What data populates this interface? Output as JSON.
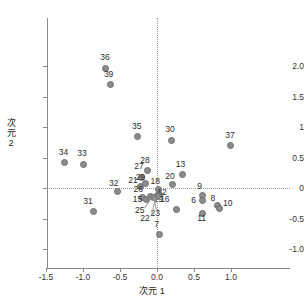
{
  "chart_data": {
    "type": "scatter",
    "title": "",
    "xlabel": "次元 1",
    "ylabel": "次元 2",
    "xlim": [
      -1.85,
      1.35
    ],
    "ylim": [
      -1.05,
      2.25
    ],
    "xticks": [
      "-1.5",
      "-1.0",
      "-0.5",
      "0.0",
      "0.5",
      "1.0"
    ],
    "xtick_values": [
      -1.5,
      -1.0,
      -0.5,
      0.0,
      0.5,
      1.0
    ],
    "yticks": [
      "2.0",
      "1.5",
      "1",
      "0.5",
      "0",
      "-0.5",
      "-1.0"
    ],
    "ytick_values": [
      2.0,
      1.5,
      1.0,
      0.5,
      0.0,
      -0.5,
      -1.0
    ],
    "grid": false,
    "reference_lines": {
      "x": 0,
      "y": 0,
      "style": "dotted"
    },
    "marker_color": "#8c8c8c",
    "legend": "none",
    "points": [
      {
        "label": "36",
        "x": -0.7,
        "y": 1.96,
        "lx": -0.7,
        "ly": 2.13
      },
      {
        "label": "39",
        "x": -0.63,
        "y": 1.69,
        "lx": -0.65,
        "ly": 1.86
      },
      {
        "label": "35",
        "x": -0.27,
        "y": 0.84,
        "lx": -0.27,
        "ly": 1.0
      },
      {
        "label": "30",
        "x": 0.19,
        "y": 0.78,
        "lx": 0.18,
        "ly": 0.95
      },
      {
        "label": "37",
        "x": 0.99,
        "y": 0.69,
        "lx": 0.99,
        "ly": 0.85
      },
      {
        "label": "34",
        "x": -1.25,
        "y": 0.42,
        "lx": -1.26,
        "ly": 0.58
      },
      {
        "label": "33",
        "x": -1.0,
        "y": 0.38,
        "lx": -1.01,
        "ly": 0.55
      },
      {
        "label": "28",
        "x": -0.13,
        "y": 0.29,
        "lx": -0.16,
        "ly": 0.45
      },
      {
        "label": "27",
        "x": -0.21,
        "y": 0.18,
        "lx": -0.24,
        "ly": 0.34
      },
      {
        "label": "13",
        "x": 0.34,
        "y": 0.22,
        "lx": 0.32,
        "ly": 0.38
      },
      {
        "label": "29",
        "x": -0.16,
        "y": 0.08,
        "lx": -0.22,
        "ly": 0.16
      },
      {
        "label": "20",
        "x": 0.21,
        "y": 0.05,
        "lx": 0.18,
        "ly": 0.18
      },
      {
        "label": "21",
        "x": -0.22,
        "y": 0.02,
        "lx": -0.32,
        "ly": 0.12
      },
      {
        "label": "18",
        "x": 0.02,
        "y": -0.02,
        "lx": -0.02,
        "ly": 0.1
      },
      {
        "label": "32",
        "x": -0.53,
        "y": -0.06,
        "lx": -0.58,
        "ly": 0.06
      },
      {
        "label": "9",
        "x": 0.62,
        "y": -0.12,
        "lx": 0.61,
        "ly": 0.02
      },
      {
        "label": "26",
        "x": -0.2,
        "y": -0.16,
        "lx": -0.25,
        "ly": -0.04
      },
      {
        "label": "12",
        "x": 0.04,
        "y": -0.11,
        "lx": 0.07,
        "ly": -0.08
      },
      {
        "label": "31",
        "x": -0.86,
        "y": -0.39,
        "lx": -0.93,
        "ly": -0.23
      },
      {
        "label": "15",
        "x": -0.14,
        "y": -0.19,
        "lx": -0.26,
        "ly": -0.19
      },
      {
        "label": "19",
        "x": 0.01,
        "y": -0.13,
        "lx": 0.02,
        "ly": -0.2
      },
      {
        "label": "16",
        "x": 0.26,
        "y": -0.35,
        "lx": 0.11,
        "ly": -0.2
      },
      {
        "label": "6",
        "x": 0.61,
        "y": -0.21,
        "lx": 0.53,
        "ly": -0.22
      },
      {
        "label": "8",
        "x": 0.82,
        "y": -0.29,
        "lx": 0.79,
        "ly": -0.18
      },
      {
        "label": "10",
        "x": 0.85,
        "y": -0.33,
        "lx": 0.96,
        "ly": -0.27
      },
      {
        "label": "11",
        "x": 0.62,
        "y": -0.41,
        "lx": 0.61,
        "ly": -0.51
      },
      {
        "label": "25",
        "x": -0.09,
        "y": -0.14,
        "lx": -0.23,
        "ly": -0.38
      },
      {
        "label": "23",
        "x": 0.0,
        "y": -0.14,
        "lx": -0.02,
        "ly": -0.43
      },
      {
        "label": "22",
        "x": -0.05,
        "y": -0.16,
        "lx": -0.16,
        "ly": -0.5
      },
      {
        "label": "7",
        "x": 0.04,
        "y": -0.77,
        "lx": 0.03,
        "ly": -0.61
      }
    ],
    "leader_lines": [
      {
        "from_label": "25",
        "x1": -0.175,
        "y1": -0.33,
        "x2": -0.085,
        "y2": -0.17
      },
      {
        "from_label": "23",
        "x1": -0.015,
        "y1": -0.38,
        "x2": -0.045,
        "y2": -0.17
      },
      {
        "from_label": "22",
        "x1": -0.085,
        "y1": -0.45,
        "x2": -0.03,
        "y2": -0.18
      }
    ]
  }
}
